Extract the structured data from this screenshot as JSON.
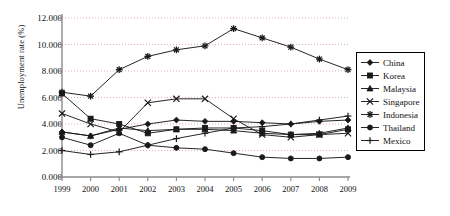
{
  "chart_data": {
    "type": "line",
    "title": "",
    "xlabel": "",
    "ylabel": "Unemployment rate (%)",
    "x": [
      1999,
      2000,
      2001,
      2002,
      2003,
      2004,
      2005,
      2006,
      2007,
      2008,
      2009
    ],
    "xtick_labels": [
      "1999",
      "2000",
      "2001",
      "2002",
      "2003",
      "2004",
      "2005",
      "2006",
      "2007",
      "2008",
      "2009"
    ],
    "ytick_labels": [
      "0.000",
      "2.000",
      "4.000",
      "6.000",
      "8.000",
      "10.000",
      "12.000"
    ],
    "ytick_values": [
      0,
      2,
      4,
      6,
      8,
      10,
      12
    ],
    "ylim": [
      0,
      12
    ],
    "grid": true,
    "legend_position": "right",
    "series": [
      {
        "name": "China",
        "marker": "diamond",
        "values": [
          3.4,
          3.1,
          3.6,
          4.0,
          4.3,
          4.2,
          4.2,
          4.1,
          4.0,
          4.2,
          4.3
        ]
      },
      {
        "name": "Korea",
        "marker": "square",
        "values": [
          6.3,
          4.4,
          4.0,
          3.3,
          3.6,
          3.7,
          3.7,
          3.5,
          3.2,
          3.2,
          3.6
        ]
      },
      {
        "name": "Malaysia",
        "marker": "triangle",
        "values": [
          3.4,
          3.1,
          3.7,
          3.5,
          3.6,
          3.6,
          3.5,
          3.3,
          3.2,
          3.3,
          3.7
        ]
      },
      {
        "name": "Singapore",
        "marker": "cross-x",
        "values": [
          4.8,
          4.0,
          3.4,
          5.6,
          5.9,
          5.9,
          4.4,
          3.2,
          3.0,
          3.2,
          3.3
        ]
      },
      {
        "name": "Indonesia",
        "marker": "asterisk",
        "values": [
          6.4,
          6.1,
          8.1,
          9.1,
          9.6,
          9.9,
          11.2,
          10.5,
          9.8,
          8.9,
          8.1
        ]
      },
      {
        "name": "Thailand",
        "marker": "circle",
        "values": [
          3.0,
          2.4,
          3.3,
          2.4,
          2.2,
          2.1,
          1.8,
          1.5,
          1.4,
          1.4,
          1.5
        ]
      },
      {
        "name": "Mexico",
        "marker": "plus",
        "values": [
          2.0,
          1.7,
          1.9,
          2.4,
          2.9,
          3.3,
          3.7,
          3.8,
          4.0,
          4.3,
          4.6
        ]
      }
    ]
  },
  "legend": {
    "items": [
      {
        "label": "China"
      },
      {
        "label": "Korea"
      },
      {
        "label": "Malaysia"
      },
      {
        "label": "Singapore"
      },
      {
        "label": "Indonesia"
      },
      {
        "label": "Thailand"
      },
      {
        "label": "Mexico"
      }
    ]
  },
  "colors": {
    "line": "#1a1a1a",
    "grid": "#d9a9a9",
    "axis": "#8a8a8a",
    "text": "#111111"
  }
}
